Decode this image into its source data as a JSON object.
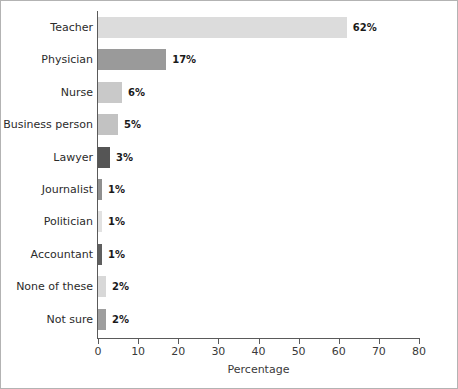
{
  "figure": {
    "border_color": "#b3b3b3",
    "background": "#ffffff",
    "axis_color": "#5a5a5a"
  },
  "chart_data": {
    "type": "bar",
    "orientation": "horizontal",
    "title": "",
    "subtitle": "",
    "xlabel": "Percentage",
    "ylabel": "",
    "xlim": [
      0,
      80
    ],
    "ylim": null,
    "grid": false,
    "legend": null,
    "xticks": [
      0,
      10,
      20,
      30,
      40,
      50,
      60,
      70,
      80
    ],
    "xtick_labels": [
      "0",
      "10",
      "20",
      "30",
      "40",
      "50",
      "60",
      "70",
      "80"
    ],
    "categories": [
      "Teacher",
      "Physician",
      "Nurse",
      "Business person",
      "Lawyer",
      "Journalist",
      "Politician",
      "Accountant",
      "None of these",
      "Not sure"
    ],
    "values": [
      62,
      17,
      6,
      5,
      3,
      1,
      1,
      1,
      2,
      2
    ],
    "value_labels": [
      "62%",
      "17%",
      "6%",
      "5%",
      "3%",
      "1%",
      "1%",
      "1%",
      "2%",
      "2%"
    ],
    "bar_colors": [
      "#dcdcdc",
      "#9a9a9a",
      "#c9c9c9",
      "#c2c2c2",
      "#555555",
      "#8f8f8f",
      "#e2e2e2",
      "#5f5f5f",
      "#d8d8d8",
      "#9e9e9e"
    ]
  }
}
